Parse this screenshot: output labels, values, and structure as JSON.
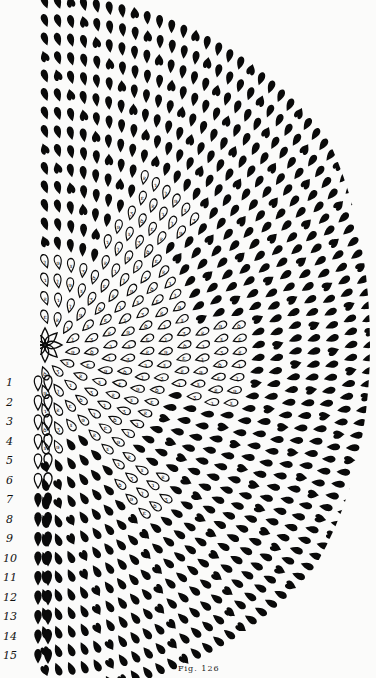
{
  "figure": {
    "caption": "Fig. 126",
    "colors": {
      "ink": "#0a0a0a",
      "paper": "#fbfbfa"
    }
  },
  "row_labels": [
    "1",
    "2",
    "3",
    "4",
    "5",
    "6",
    "7",
    "8",
    "9",
    "10",
    "11",
    "12",
    "13",
    "14",
    "15"
  ],
  "rows": {
    "total": 15,
    "outlined_rows": [
      1,
      2,
      3,
      4,
      5,
      6
    ],
    "solid_rows": [
      7,
      8,
      9,
      10,
      11,
      12,
      13,
      14,
      15
    ]
  },
  "petal_symbols": [
    "ꝺ",
    "ε",
    "ƨ",
    "ɿ",
    "ʅ",
    "ɘ",
    "ɤ",
    "ʒ"
  ]
}
